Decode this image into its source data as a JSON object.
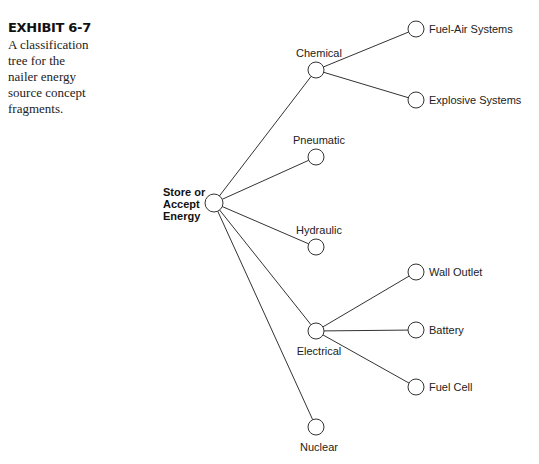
{
  "caption": {
    "title": "EXHIBIT 6-7",
    "lines": [
      "A classification",
      "tree for the",
      "nailer energy",
      "source concept",
      "fragments."
    ]
  },
  "tree": {
    "root": {
      "id": "root",
      "label_lines": [
        "Store or",
        "Accept",
        "Energy"
      ],
      "x": 214,
      "y": 203
    },
    "nodes": [
      {
        "id": "chemical",
        "label": "Chemical",
        "x": 316,
        "y": 70,
        "parent": "root",
        "label_pos": "above"
      },
      {
        "id": "fuel-air",
        "label": "Fuel-Air Systems",
        "x": 416,
        "y": 29,
        "parent": "chemical",
        "label_pos": "right"
      },
      {
        "id": "explosive",
        "label": "Explosive Systems",
        "x": 416,
        "y": 100,
        "parent": "chemical",
        "label_pos": "right"
      },
      {
        "id": "pneumatic",
        "label": "Pneumatic",
        "x": 316,
        "y": 157,
        "parent": "root",
        "label_pos": "above"
      },
      {
        "id": "hydraulic",
        "label": "Hydraulic",
        "x": 316,
        "y": 247,
        "parent": "root",
        "label_pos": "above"
      },
      {
        "id": "electrical",
        "label": "Electrical",
        "x": 316,
        "y": 331,
        "parent": "root",
        "label_pos": "below"
      },
      {
        "id": "wall-outlet",
        "label": "Wall Outlet",
        "x": 416,
        "y": 272,
        "parent": "electrical",
        "label_pos": "right"
      },
      {
        "id": "battery",
        "label": "Battery",
        "x": 416,
        "y": 330,
        "parent": "electrical",
        "label_pos": "right"
      },
      {
        "id": "fuel-cell",
        "label": "Fuel Cell",
        "x": 416,
        "y": 387,
        "parent": "electrical",
        "label_pos": "right"
      },
      {
        "id": "nuclear",
        "label": "Nuclear",
        "x": 316,
        "y": 427,
        "parent": "root",
        "label_pos": "below"
      }
    ]
  }
}
